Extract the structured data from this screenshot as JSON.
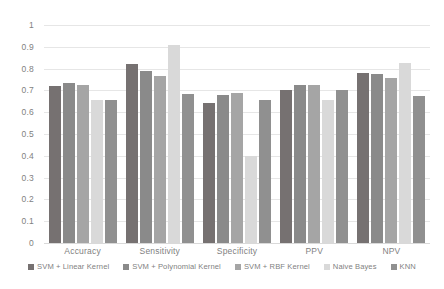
{
  "chart_data": {
    "type": "bar",
    "title": "",
    "xlabel": "",
    "ylabel": "",
    "ylim": [
      0,
      1
    ],
    "ytick_labels": [
      "1",
      "0.9",
      "0.8",
      "0.7",
      "0.6",
      "0.5",
      "0.4",
      "0.3",
      "0.2",
      "0.1",
      "0"
    ],
    "ytick_values": [
      1,
      0.9,
      0.8,
      0.7,
      0.6,
      0.5,
      0.4,
      0.3,
      0.2,
      0.1,
      0
    ],
    "grid": true,
    "legend_position": "bottom",
    "categories": [
      "Accuracy",
      "Sensitivity",
      "Specificity",
      "PPV",
      "NPV"
    ],
    "series": [
      {
        "name": "SVM + Linear Kernel",
        "color": "#767171",
        "values": [
          0.72,
          0.82,
          0.64,
          0.7,
          0.78
        ]
      },
      {
        "name": "SVM + Polynomial Kernel",
        "color": "#8a8a8a",
        "values": [
          0.735,
          0.79,
          0.68,
          0.725,
          0.775
        ]
      },
      {
        "name": "SVM + RBF Kernel",
        "color": "#a5a5a5",
        "values": [
          0.725,
          0.765,
          0.69,
          0.725,
          0.755
        ]
      },
      {
        "name": "Naive Bayes",
        "color": "#d9d9d9",
        "values": [
          0.655,
          0.91,
          0.4,
          0.655,
          0.825
        ]
      },
      {
        "name": "KNN",
        "color": "#909090",
        "values": [
          0.655,
          0.685,
          0.655,
          0.7,
          0.675
        ]
      }
    ]
  }
}
